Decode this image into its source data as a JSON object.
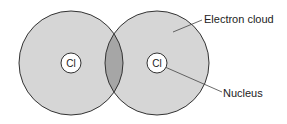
{
  "diagram": {
    "atoms": [
      {
        "symbol": "Cl",
        "cx": 71,
        "cy": 63,
        "r": 52
      },
      {
        "symbol": "Cl",
        "cx": 157,
        "cy": 63,
        "r": 52
      }
    ],
    "labels": {
      "electron_cloud": "Electron cloud",
      "nucleus": "Nucleus"
    },
    "colors": {
      "cloud_fill": "#d6d6d6",
      "overlap_fill": "#a6a6a6",
      "outline": "#333333",
      "nucleus_fill": "#ffffff"
    }
  }
}
